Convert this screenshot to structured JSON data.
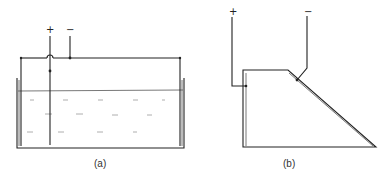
{
  "panel_a": {
    "label": "(a)",
    "plus": "+",
    "minus": "−"
  },
  "panel_b": {
    "label": "(b)",
    "plus": "+",
    "minus": "−"
  }
}
